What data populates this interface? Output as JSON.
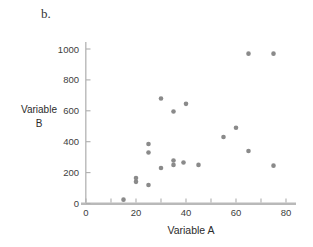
{
  "figure": {
    "panel_label": "b.",
    "background": "#ffffff"
  },
  "chart_data": {
    "type": "scatter",
    "title": "",
    "xlabel": "Variable A",
    "ylabel": "Variable B",
    "ylabel_lines": {
      "line1": "Variable",
      "line2": "B"
    },
    "xlim": [
      0,
      84
    ],
    "ylim": [
      0,
      1045
    ],
    "x_ticks": [
      0,
      20,
      40,
      60,
      80
    ],
    "x_minor_tick_step": 10,
    "y_ticks": [
      0,
      200,
      400,
      600,
      800,
      1000
    ],
    "grid": false,
    "legend": "none",
    "marker": "circle",
    "points": [
      [
        15,
        25
      ],
      [
        20,
        140
      ],
      [
        20,
        165
      ],
      [
        25,
        120
      ],
      [
        25,
        330
      ],
      [
        25,
        385
      ],
      [
        30,
        230
      ],
      [
        30,
        680
      ],
      [
        35,
        250
      ],
      [
        35,
        278
      ],
      [
        35,
        595
      ],
      [
        39,
        265
      ],
      [
        40,
        645
      ],
      [
        45,
        250
      ],
      [
        55,
        430
      ],
      [
        60,
        490
      ],
      [
        65,
        340
      ],
      [
        65,
        970
      ],
      [
        75,
        245
      ],
      [
        75,
        970
      ]
    ],
    "colors": {
      "point": "#8a8a8a",
      "axis": "#b9b9b9",
      "tick": "#aeaeae",
      "tick_label": "#3d3d3d",
      "label": "#2b2b2b"
    }
  }
}
